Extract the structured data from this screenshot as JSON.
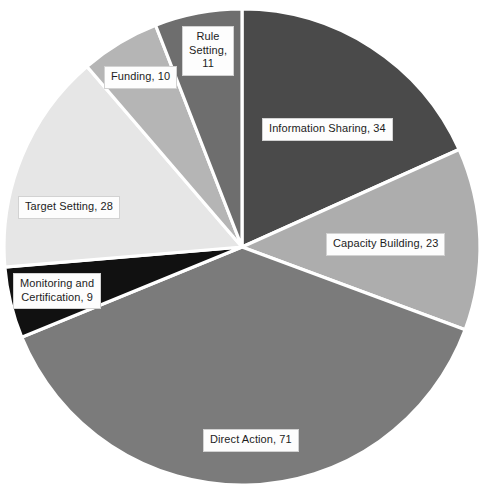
{
  "chart_data": {
    "type": "pie",
    "title": "",
    "subtitle": "",
    "xlabel": "",
    "ylabel": "",
    "legend": "none",
    "grid": false,
    "label_format": "name, value",
    "total": 186,
    "start_angle_deg": 0,
    "direction": "clockwise",
    "categories": [
      "Information Sharing",
      "Capacity Building",
      "Direct Action",
      "Monitoring and Certification",
      "Target Setting",
      "Funding",
      "Rule Setting"
    ],
    "values": [
      34,
      23,
      71,
      9,
      28,
      10,
      11
    ],
    "slices": [
      {
        "name": "Information Sharing",
        "value": 34,
        "label": "Information Sharing, 34",
        "label_lines": [
          "Information Sharing, 34"
        ],
        "color": "#4a4a4a",
        "percent": 18.3
      },
      {
        "name": "Capacity Building",
        "value": 23,
        "label": "Capacity Building, 23",
        "label_lines": [
          "Capacity Building, 23"
        ],
        "color": "#adadad",
        "percent": 12.4
      },
      {
        "name": "Direct Action",
        "value": 71,
        "label": "Direct Action, 71",
        "label_lines": [
          "Direct Action, 71"
        ],
        "color": "#7b7b7b",
        "percent": 38.2
      },
      {
        "name": "Monitoring and Certification",
        "value": 9,
        "label": "Monitoring and Certification, 9",
        "label_lines": [
          "Monitoring and",
          "Certification, 9"
        ],
        "color": "#111111",
        "percent": 4.8
      },
      {
        "name": "Target Setting",
        "value": 28,
        "label": "Target Setting, 28",
        "label_lines": [
          "Target Setting, 28"
        ],
        "color": "#e6e6e6",
        "percent": 15.1
      },
      {
        "name": "Funding",
        "value": 10,
        "label": "Funding, 10",
        "label_lines": [
          "Funding, 10"
        ],
        "color": "#b5b5b5",
        "percent": 5.4
      },
      {
        "name": "Rule Setting",
        "value": 11,
        "label": "Rule Setting, 11",
        "label_lines": [
          "Rule",
          "Setting,",
          "11"
        ],
        "color": "#6e6e6e",
        "percent": 5.9
      }
    ],
    "geometry": {
      "center_x": 242,
      "center_y": 247,
      "radius": 238,
      "separator_color": "#ffffff"
    }
  }
}
